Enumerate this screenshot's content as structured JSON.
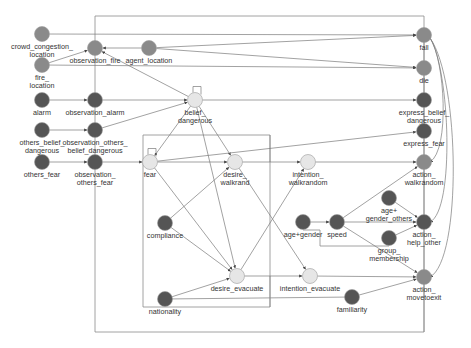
{
  "colors": {
    "medium": "#8a8a8a",
    "dark": "#555555",
    "light": "#e6e6e6",
    "edge": "#7a7a7a",
    "frame": "#8a8a8a"
  },
  "nodes": [
    {
      "id": "crowd_congestion_location",
      "lines": [
        "crowd_congestion_",
        "location"
      ],
      "x": 42,
      "y": 34,
      "shade": "medium"
    },
    {
      "id": "fire_location",
      "lines": [
        "fire_",
        "location"
      ],
      "x": 42,
      "y": 65,
      "shade": "medium"
    },
    {
      "id": "observation_fire",
      "lines": [
        "observation_fire"
      ],
      "x": 95,
      "y": 48,
      "shade": "medium"
    },
    {
      "id": "agent_location",
      "lines": [
        "agent_location"
      ],
      "x": 149,
      "y": 48,
      "shade": "medium"
    },
    {
      "id": "alarm",
      "lines": [
        "alarm"
      ],
      "x": 42,
      "y": 100,
      "shade": "dark"
    },
    {
      "id": "observation_alarm",
      "lines": [
        "observation_alarm"
      ],
      "x": 95,
      "y": 100,
      "shade": "dark"
    },
    {
      "id": "others_belief_dangerous",
      "lines": [
        "others_belief_",
        "dangerous"
      ],
      "x": 42,
      "y": 130,
      "shade": "dark"
    },
    {
      "id": "observation_others_belief_dangerous",
      "lines": [
        "observation_others_",
        "belief_dangerous"
      ],
      "x": 95,
      "y": 130,
      "shade": "dark"
    },
    {
      "id": "others_fear",
      "lines": [
        "others_fear"
      ],
      "x": 42,
      "y": 162,
      "shade": "dark"
    },
    {
      "id": "observation_others_fear",
      "lines": [
        "observation_",
        "others_fear"
      ],
      "x": 95,
      "y": 162,
      "shade": "dark"
    },
    {
      "id": "belief_dangerous",
      "lines": [
        "belief_",
        "dangerous"
      ],
      "x": 195,
      "y": 100,
      "shade": "light"
    },
    {
      "id": "fear",
      "lines": [
        "fear"
      ],
      "x": 150,
      "y": 162,
      "shade": "light"
    },
    {
      "id": "desire_walkrand",
      "lines": [
        "desire_",
        "walkrand"
      ],
      "x": 235,
      "y": 162,
      "shade": "light"
    },
    {
      "id": "intention_walkrandom",
      "lines": [
        "intention_",
        "walkrandom"
      ],
      "x": 308,
      "y": 162,
      "shade": "light"
    },
    {
      "id": "compliance",
      "lines": [
        "compliance"
      ],
      "x": 165,
      "y": 223,
      "shade": "dark"
    },
    {
      "id": "nationality",
      "lines": [
        "nationality"
      ],
      "x": 165,
      "y": 299,
      "shade": "dark"
    },
    {
      "id": "desire_evacuate",
      "lines": [
        "desire_evacuate"
      ],
      "x": 237,
      "y": 276,
      "shade": "light"
    },
    {
      "id": "intention_evacuate",
      "lines": [
        "intention_evacuate"
      ],
      "x": 310,
      "y": 276,
      "shade": "light"
    },
    {
      "id": "familiarity",
      "lines": [
        "familiarity"
      ],
      "x": 352,
      "y": 297,
      "shade": "dark"
    },
    {
      "id": "age_gender",
      "lines": [
        "age+gender"
      ],
      "x": 303,
      "y": 222,
      "shade": "dark"
    },
    {
      "id": "speed",
      "lines": [
        "speed"
      ],
      "x": 337,
      "y": 222,
      "shade": "dark"
    },
    {
      "id": "age_gender_others",
      "lines": [
        "age+",
        "gender_others"
      ],
      "x": 389,
      "y": 198,
      "shade": "dark"
    },
    {
      "id": "group_membership",
      "lines": [
        "group_",
        "membership"
      ],
      "x": 389,
      "y": 238,
      "shade": "dark"
    },
    {
      "id": "fall",
      "lines": [
        "fall"
      ],
      "x": 424,
      "y": 35,
      "shade": "medium"
    },
    {
      "id": "die",
      "lines": [
        "die"
      ],
      "x": 424,
      "y": 68,
      "shade": "medium"
    },
    {
      "id": "express_belief_dangerous",
      "lines": [
        "express_belief_",
        "dangerous"
      ],
      "x": 424,
      "y": 100,
      "shade": "dark"
    },
    {
      "id": "express_fear",
      "lines": [
        "express_fear"
      ],
      "x": 424,
      "y": 131,
      "shade": "dark"
    },
    {
      "id": "action_walkrandom",
      "lines": [
        "action_",
        "walkrandom"
      ],
      "x": 424,
      "y": 162,
      "shade": "medium"
    },
    {
      "id": "action_help_other",
      "lines": [
        "action_",
        "help_other"
      ],
      "x": 424,
      "y": 222,
      "shade": "dark"
    },
    {
      "id": "action_movetoexit",
      "lines": [
        "action_",
        "movetoexit"
      ],
      "x": 424,
      "y": 277,
      "shade": "medium"
    }
  ],
  "edges": [
    {
      "from": "crowd_congestion_location",
      "to": "fall"
    },
    {
      "from": "fire_location",
      "to": "observation_fire"
    },
    {
      "from": "fire_location",
      "to": "die"
    },
    {
      "from": "agent_location",
      "to": "observation_fire"
    },
    {
      "from": "agent_location",
      "to": "fall"
    },
    {
      "from": "agent_location",
      "to": "die"
    },
    {
      "from": "alarm",
      "to": "observation_alarm"
    },
    {
      "from": "observation_alarm",
      "to": "belief_dangerous"
    },
    {
      "from": "others_belief_dangerous",
      "to": "observation_others_belief_dangerous"
    },
    {
      "from": "observation_others_belief_dangerous",
      "to": "belief_dangerous"
    },
    {
      "from": "others_fear",
      "to": "observation_others_fear"
    },
    {
      "from": "observation_others_fear",
      "to": "fear"
    },
    {
      "from": "belief_dangerous",
      "to": "observation_fire"
    },
    {
      "from": "belief_dangerous",
      "to": "express_belief_dangerous"
    },
    {
      "from": "belief_dangerous",
      "to": "fear"
    },
    {
      "from": "belief_dangerous",
      "to": "desire_walkrand"
    },
    {
      "from": "belief_dangerous",
      "to": "desire_evacuate"
    },
    {
      "from": "fear",
      "to": "desire_walkrand"
    },
    {
      "from": "fear",
      "to": "express_fear"
    },
    {
      "from": "fear",
      "to": "desire_evacuate"
    },
    {
      "from": "compliance",
      "to": "desire_walkrand"
    },
    {
      "from": "compliance",
      "to": "desire_evacuate"
    },
    {
      "from": "nationality",
      "to": "desire_evacuate"
    },
    {
      "from": "desire_walkrand",
      "to": "intention_walkrandom"
    },
    {
      "from": "desire_walkrand",
      "to": "intention_evacuate"
    },
    {
      "from": "desire_evacuate",
      "to": "intention_walkrandom"
    },
    {
      "from": "desire_evacuate",
      "to": "intention_evacuate"
    },
    {
      "from": "intention_walkrandom",
      "to": "action_walkrandom"
    },
    {
      "from": "intention_evacuate",
      "to": "action_movetoexit"
    },
    {
      "from": "familiarity",
      "to": "action_movetoexit"
    },
    {
      "from": "age_gender",
      "to": "speed"
    },
    {
      "from": "speed",
      "to": "action_walkrandom"
    },
    {
      "from": "speed",
      "to": "action_help_other"
    },
    {
      "from": "speed",
      "to": "action_movetoexit"
    },
    {
      "from": "age_gender_others",
      "to": "action_help_other"
    },
    {
      "from": "group_membership",
      "to": "action_help_other"
    }
  ],
  "frames": [
    {
      "name": "outer-frame",
      "points": "95,16 424,16 424,332 95,332 95,16"
    },
    {
      "name": "inner-frame",
      "points": "143,135 270,135 270,307 143,307 143,135"
    },
    {
      "name": "walkrand-frame",
      "points": "270,135 270,162"
    },
    {
      "name": "evacuate-frame",
      "points": "270,276 270,307"
    },
    {
      "name": "nationality-line",
      "points": "165,299 352,297"
    },
    {
      "name": "speed-loop",
      "points": "303,230 320,230 320,246 389,246"
    },
    {
      "name": "right-vertical",
      "points": "424,35 424,332"
    }
  ],
  "curves": [
    {
      "name": "fall-to-action-walkrandom",
      "d": "M430,38 C445,60 450,150 430,162"
    },
    {
      "name": "fall-to-action-help-other",
      "d": "M430,38 C450,70 455,210 430,222"
    },
    {
      "name": "fall-to-action-movetoexit",
      "d": "M430,38 C460,80 462,260 430,277"
    }
  ],
  "self_loops": [
    {
      "node": "belief_dangerous"
    },
    {
      "node": "fear"
    }
  ]
}
